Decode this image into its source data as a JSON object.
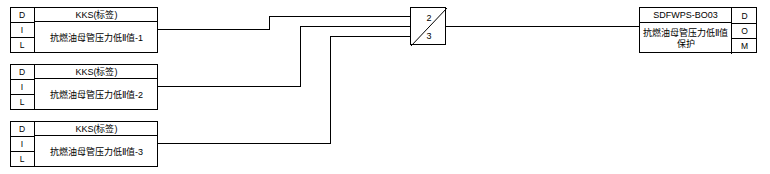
{
  "diagram": {
    "title": "",
    "inputs": [
      {
        "io_labels": [
          "D",
          "I",
          "L"
        ],
        "kks": "KKS(标签)",
        "description": "抗燃油母管压力低Ⅱ值-1"
      },
      {
        "io_labels": [
          "D",
          "I",
          "L"
        ],
        "kks": "KKS(标签)",
        "description": "抗燃油母管压力低Ⅱ值-2"
      },
      {
        "io_labels": [
          "D",
          "I",
          "L"
        ],
        "kks": "KKS(标签)",
        "description": "抗燃油母管压力低Ⅱ值-3"
      }
    ],
    "gate": {
      "numerator": "2",
      "denominator": "3",
      "name": "2oo3-voting-gate"
    },
    "output": {
      "tag": "SDFWPS-BO03",
      "description": "抗燃油母管压力低Ⅱ值保护",
      "io_labels": [
        "D",
        "O",
        "M"
      ]
    }
  }
}
